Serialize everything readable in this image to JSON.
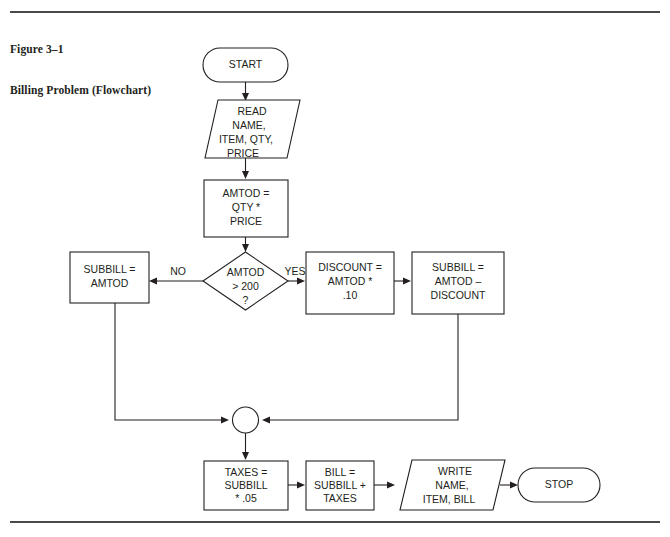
{
  "figure": {
    "number_line": "Figure 3–1",
    "title_line": "Billing Problem (Flowchart)"
  },
  "colors": {
    "ink": "#231f20",
    "rule": "#4a4a4a",
    "page_background": "#ffffff",
    "shape_fill": "#ffffff"
  },
  "flowchart": {
    "type": "flowchart",
    "nodes": {
      "start": {
        "shape": "terminal",
        "label": "START"
      },
      "read": {
        "shape": "input-output",
        "line1": "READ",
        "line2": "NAME,",
        "line3": "ITEM, QTY,",
        "line4": "PRICE"
      },
      "amtod": {
        "shape": "process",
        "line1": "AMTOD =",
        "line2": "QTY *",
        "line3": "PRICE"
      },
      "decision": {
        "shape": "decision",
        "line1": "AMTOD",
        "line2": "> 200",
        "line3": "?"
      },
      "subbill_no": {
        "shape": "process",
        "line1": "SUBBILL =",
        "line2": "AMTOD"
      },
      "discount": {
        "shape": "process",
        "line1": "DISCOUNT =",
        "line2": "AMTOD *",
        "line3": ".10"
      },
      "subbill_yes": {
        "shape": "process",
        "line1": "SUBBILL =",
        "line2": "AMTOD –",
        "line3": "DISCOUNT"
      },
      "junction": {
        "shape": "connector",
        "label": ""
      },
      "taxes": {
        "shape": "process",
        "line1": "TAXES =",
        "line2": "SUBBILL",
        "line3": "* .05"
      },
      "bill": {
        "shape": "process",
        "line1": "BILL =",
        "line2": "SUBBILL +",
        "line3": "TAXES"
      },
      "write": {
        "shape": "input-output",
        "line1": "WRITE",
        "line2": "NAME,",
        "line3": "ITEM, BILL"
      },
      "stop": {
        "shape": "terminal",
        "label": "STOP"
      }
    },
    "branch_labels": {
      "no": "NO",
      "yes": "YES"
    }
  }
}
